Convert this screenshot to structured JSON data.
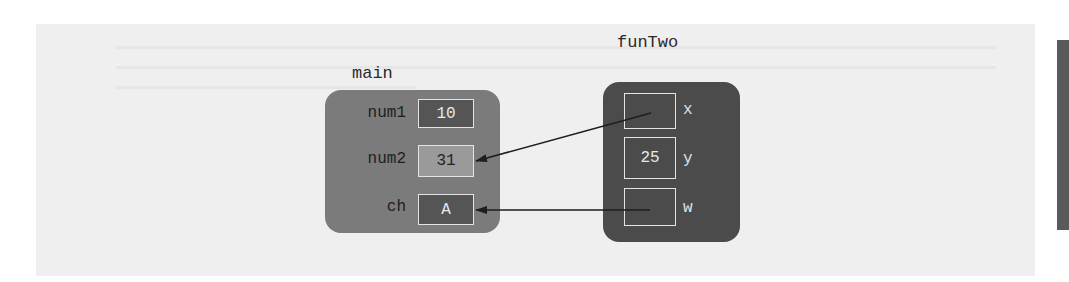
{
  "diagram": {
    "colors": {
      "background": "#ffffff",
      "panel": "#efefef",
      "main_frame": "#7b7b7b",
      "fun_frame": "#4b4b4b",
      "dark_cell": "#555555",
      "light_cell": "#9a9a9a",
      "arrow": "#1e1e1e"
    },
    "main": {
      "title": "main",
      "variables": [
        {
          "name": "num1",
          "value": "10"
        },
        {
          "name": "num2",
          "value": "31"
        },
        {
          "name": "ch",
          "value": "A"
        }
      ]
    },
    "funTwo": {
      "title": "funTwo",
      "parameters": [
        {
          "name": "x",
          "value": "",
          "points_to": "num2"
        },
        {
          "name": "y",
          "value": "25"
        },
        {
          "name": "w",
          "value": "",
          "points_to": "ch"
        }
      ]
    }
  }
}
